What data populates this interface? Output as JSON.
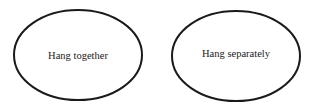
{
  "diagram": {
    "nodes": [
      {
        "id": "left",
        "label": "Hang together",
        "cx": 78,
        "cy": 55,
        "rx": 64,
        "ry": 45
      },
      {
        "id": "right",
        "label": "Hang separately",
        "cx": 236,
        "cy": 56,
        "rx": 64,
        "ry": 45
      }
    ],
    "stroke_color": "#1a1a1a",
    "background": "#ffffff"
  }
}
